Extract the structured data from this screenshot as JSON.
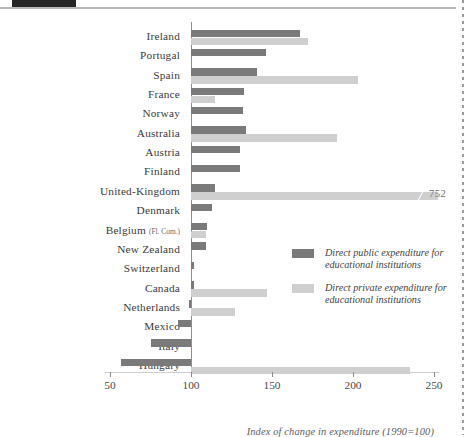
{
  "header": {
    "tab_color": "#262626",
    "rule_color": "#b9b9b9"
  },
  "colors": {
    "public": "#7a7a7a",
    "private": "#cfcfcf",
    "baseline": "#8e8e8e",
    "text": "#3a3a3a"
  },
  "legend": {
    "items": [
      {
        "label": "Direct public expenditure for educational institutions",
        "color": "#7a7a7a",
        "swatch_name": "legend-swatch-public"
      },
      {
        "label": "Direct private expenditure for educational institutions",
        "color": "#cfcfcf",
        "swatch_name": "legend-swatch-private"
      }
    ]
  },
  "axis": {
    "caption": "Index of change in expenditure (1990=100)",
    "ticks": [
      "50",
      "100",
      "150",
      "200",
      "250"
    ],
    "tick_values": [
      50,
      100,
      150,
      200,
      250
    ],
    "min": 50,
    "max": 250
  },
  "annotations": [
    {
      "label": "752",
      "series": "private",
      "category": "United-Kingdom"
    }
  ],
  "chart_data": {
    "type": "bar",
    "orientation": "horizontal",
    "title": "",
    "xlabel": "Index of change in expenditure (1990=100)",
    "ylabel": "",
    "xlim": [
      50,
      250
    ],
    "baseline": 100,
    "grid": false,
    "legend_position": "inside-right",
    "categories": [
      "Ireland",
      "Portugal",
      "Spain",
      "France",
      "Norway",
      "Australia",
      "Austria",
      "Finland",
      "United-Kingdom",
      "Denmark",
      "Belgium (Fl. Com.)",
      "New Zealand",
      "Switzerland",
      "Canada",
      "Netherlands",
      "Mexico",
      "Italy",
      "Hungary"
    ],
    "series": [
      {
        "name": "Direct public expenditure for educational institutions",
        "color": "#7a7a7a",
        "values": [
          167,
          146,
          141,
          133,
          132,
          134,
          130,
          130,
          115,
          113,
          110,
          109,
          102,
          102,
          99,
          92,
          75,
          57
        ]
      },
      {
        "name": "Direct private expenditure for educational institutions",
        "color": "#cfcfcf",
        "values": [
          172,
          null,
          203,
          115,
          null,
          190,
          null,
          null,
          752,
          null,
          109,
          null,
          null,
          147,
          127,
          null,
          null,
          235
        ]
      }
    ],
    "notes": [
      "United-Kingdom private expenditure bar is truncated at the axis edge and labelled 752."
    ]
  }
}
